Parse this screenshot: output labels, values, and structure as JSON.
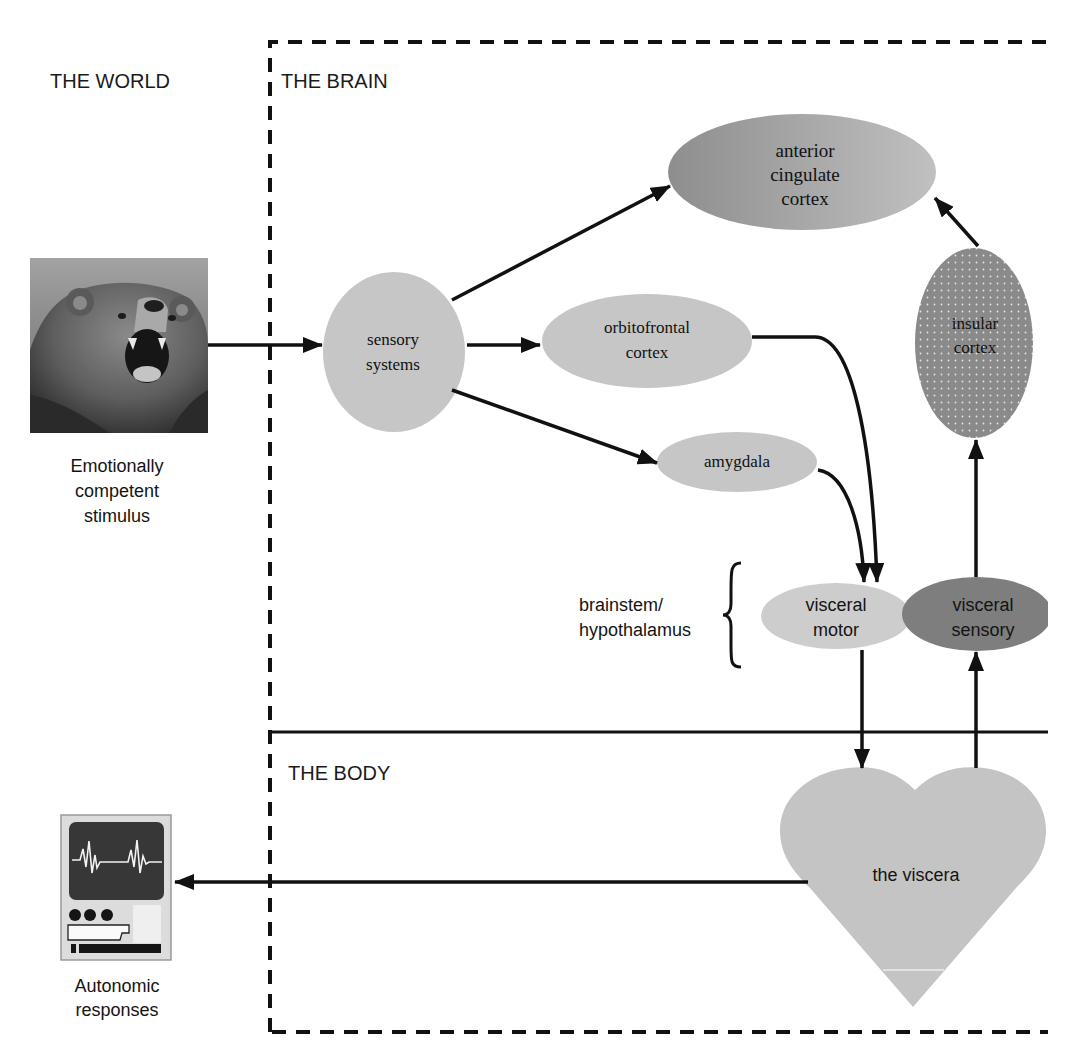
{
  "figure": {
    "regions": {
      "world": "THE WORLD",
      "brain": "THE BRAIN",
      "body": "THE BODY"
    },
    "nodes": {
      "stimulus": {
        "lines": [
          "Emotionally",
          "competent",
          "stimulus"
        ],
        "icon": "bear-photo-icon"
      },
      "sensory_systems": {
        "lines": [
          "sensory",
          "systems"
        ]
      },
      "orbitofrontal_cortex": {
        "lines": [
          "orbitofrontal",
          "cortex"
        ]
      },
      "amygdala": {
        "lines": [
          "amygdala"
        ]
      },
      "anterior_cingulate_cortex": {
        "lines": [
          "anterior",
          "cingulate",
          "cortex"
        ]
      },
      "insular_cortex": {
        "lines": [
          "insular",
          "cortex"
        ]
      },
      "visceral_motor": {
        "lines": [
          "visceral",
          "motor"
        ]
      },
      "visceral_sensory": {
        "lines": [
          "visceral",
          "sensory"
        ]
      },
      "viscera": {
        "lines": [
          "the viscera"
        ],
        "icon": "heart-icon"
      },
      "autonomic_responses": {
        "lines": [
          "Autonomic",
          "responses"
        ],
        "icon": "heart-monitor-icon"
      }
    },
    "brace_label": {
      "lines": [
        "brainstem/",
        "hypothalamus"
      ]
    },
    "edges": [
      {
        "from": "stimulus",
        "to": "sensory_systems"
      },
      {
        "from": "sensory_systems",
        "to": "anterior_cingulate_cortex"
      },
      {
        "from": "sensory_systems",
        "to": "orbitofrontal_cortex"
      },
      {
        "from": "sensory_systems",
        "to": "amygdala"
      },
      {
        "from": "orbitofrontal_cortex",
        "to": "visceral_motor"
      },
      {
        "from": "amygdala",
        "to": "visceral_motor"
      },
      {
        "from": "visceral_motor",
        "to": "viscera"
      },
      {
        "from": "viscera",
        "to": "visceral_sensory"
      },
      {
        "from": "visceral_sensory",
        "to": "insular_cortex"
      },
      {
        "from": "insular_cortex",
        "to": "anterior_cingulate_cortex"
      },
      {
        "from": "viscera",
        "to": "autonomic_responses"
      }
    ],
    "colors": {
      "light_node": "#c6c6c6",
      "acc_gradient_start": "#8e8e8e",
      "acc_gradient_end": "#bebebe",
      "insular": "#8a8a8a",
      "visceral_sensory": "#7e7e7e",
      "visceral_motor": "#cdcdcd",
      "heart": "#c4c4c4",
      "line": "#111111"
    }
  }
}
